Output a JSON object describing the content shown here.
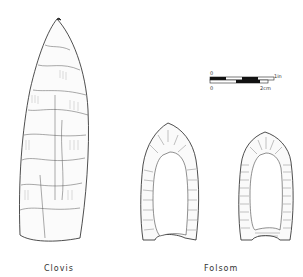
{
  "figure": {
    "labels": {
      "clovis": "Clovis",
      "folsom": "Folsom"
    },
    "scale_bar": {
      "top_start": "0",
      "top_end": "1in",
      "bottom_start": "0",
      "bottom_end": "2cm"
    }
  }
}
